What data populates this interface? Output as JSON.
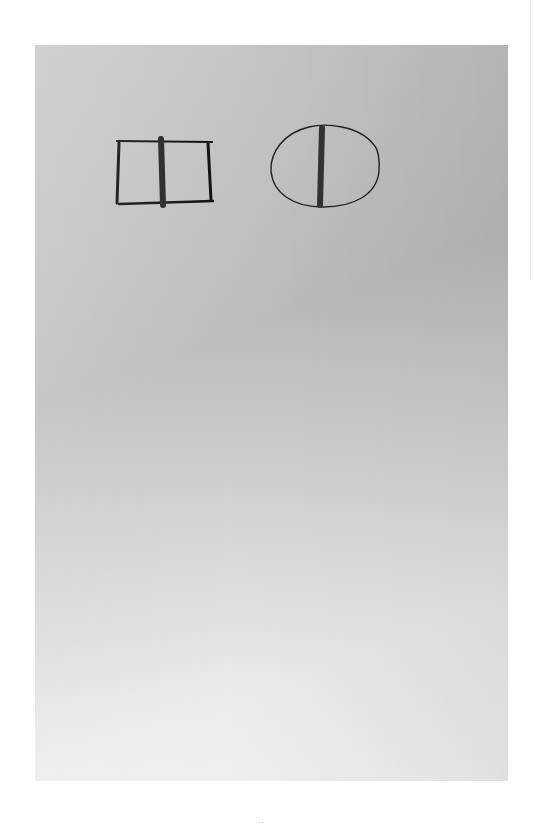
{
  "document": {
    "type": "scanned-photo-page",
    "photo": {
      "background_color_dark": "#bdbdbd",
      "background_color_light": "#f4f4f4"
    },
    "drawings": [
      {
        "shape": "rectangle",
        "description": "hand-drawn rectangle with thick vertical bar in center",
        "stroke": "#111111",
        "bar_color": "#2a2a2a"
      },
      {
        "shape": "ellipse",
        "description": "hand-drawn ellipse with thick vertical bar in center",
        "stroke": "#222222",
        "bar_color": "#333333"
      }
    ],
    "bleed_through_text": "",
    "page_number": "··"
  }
}
